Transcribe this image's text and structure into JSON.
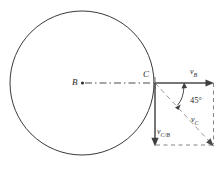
{
  "figure": {
    "name": "rolling-wheel-velocity-diagram",
    "type": "diagram",
    "background_color": "#ffffff",
    "stroke_color": "#3a3a3a",
    "dash_color": "#6a6a6a",
    "canvas": {
      "width": 219,
      "height": 169
    }
  },
  "circle": {
    "label": "wheel",
    "center_x": 82,
    "center_y": 83,
    "radius": 72
  },
  "points": {
    "center": {
      "label": "B",
      "x": 82,
      "y": 83
    },
    "contact": {
      "label": "C",
      "x": 155,
      "y": 83
    }
  },
  "vectors": [
    {
      "name": "v_B",
      "label": "v",
      "subscript": "B",
      "from_x": 155,
      "from_y": 83,
      "to_x": 213,
      "to_y": 83,
      "style": "solid",
      "direction": "right"
    },
    {
      "name": "v_C_over_B",
      "label": "v",
      "subscript": "C/B",
      "from_x": 155,
      "from_y": 83,
      "to_x": 155,
      "to_y": 145,
      "style": "solid",
      "direction": "down"
    },
    {
      "name": "v_C",
      "label": "v",
      "subscript": "C",
      "from_x": 155,
      "from_y": 83,
      "to_x": 213,
      "to_y": 145,
      "style": "dashed",
      "direction": "down-right"
    }
  ],
  "angle": {
    "name": "angle-between-vB-and-vC",
    "value": "45°",
    "vertex_x": 155,
    "vertex_y": 83
  },
  "construction_lines": [
    {
      "name": "radius-B-to-C",
      "style": "dash-dot",
      "from_x": 82,
      "from_y": 83,
      "to_x": 155,
      "to_y": 83
    },
    {
      "name": "parallelogram-right-side",
      "style": "dashed",
      "from_x": 213,
      "from_y": 83,
      "to_x": 213,
      "to_y": 145
    },
    {
      "name": "parallelogram-bottom-side",
      "style": "dashed",
      "from_x": 155,
      "from_y": 145,
      "to_x": 213,
      "to_y": 145
    }
  ]
}
